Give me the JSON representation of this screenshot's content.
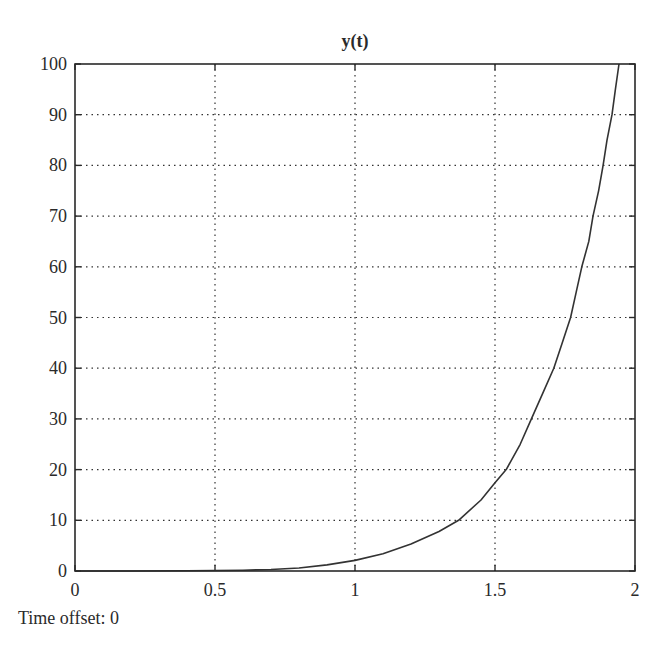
{
  "chart_data": {
    "type": "line",
    "title": "y(t)",
    "xlabel": "",
    "ylabel": "",
    "xlim": [
      0,
      2
    ],
    "ylim": [
      0,
      100
    ],
    "grid": true,
    "grid_style": "dotted",
    "legend": null,
    "x_ticks": [
      0,
      0.5,
      1,
      1.5,
      2
    ],
    "x_tick_labels": [
      "0",
      "0.5",
      "1",
      "1.5",
      "2"
    ],
    "y_ticks": [
      0,
      10,
      20,
      30,
      40,
      50,
      60,
      70,
      80,
      90,
      100
    ],
    "y_tick_labels": [
      "0",
      "10",
      "20",
      "30",
      "40",
      "50",
      "60",
      "70",
      "80",
      "90",
      "100"
    ],
    "series": [
      {
        "name": "y(t)",
        "color": "#333333",
        "x": [
          0,
          0.2,
          0.4,
          0.6,
          0.7,
          0.8,
          0.9,
          1.0,
          1.1,
          1.2,
          1.3,
          1.37,
          1.45,
          1.5,
          1.54,
          1.59,
          1.63,
          1.67,
          1.71,
          1.74,
          1.77,
          1.79,
          1.81,
          1.835,
          1.85,
          1.87,
          1.886,
          1.9,
          1.918,
          1.93,
          1.943
        ],
        "values": [
          0,
          0,
          0.05,
          0.15,
          0.3,
          0.6,
          1.2,
          2.1,
          3.4,
          5.3,
          7.8,
          10,
          14,
          17.4,
          20,
          25,
          30,
          35,
          40,
          45,
          50,
          55,
          60,
          65,
          70,
          75,
          80,
          85,
          90,
          95,
          100
        ]
      }
    ]
  },
  "footer": {
    "time_offset_label": "Time offset: 0"
  }
}
